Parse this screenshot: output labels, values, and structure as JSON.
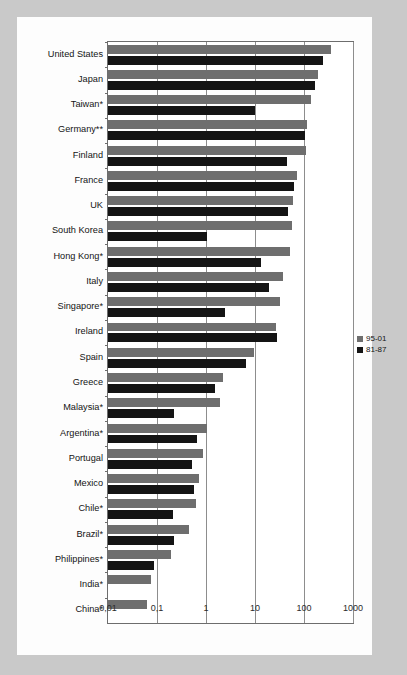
{
  "chart_data": {
    "type": "bar",
    "orientation": "horizontal",
    "title": "",
    "subtitle": "",
    "xlabel": "",
    "ylabel": "",
    "scale": "log",
    "xlim": [
      0.01,
      1000
    ],
    "grid": true,
    "legend_position": "right",
    "decimal_separator": ",",
    "xticks": [
      "0,01",
      "0,1",
      "1",
      "10",
      "100",
      "1000"
    ],
    "xtick_values": [
      0.01,
      0.1,
      1,
      10,
      100,
      1000
    ],
    "categories": [
      "United States",
      "Japan",
      "Taiwan*",
      "Germany**",
      "Finland",
      "France",
      "UK",
      "South Korea",
      "Hong Kong*",
      "Italy",
      "Singapore*",
      "Ireland",
      "Spain",
      "Greece",
      "Malaysia*",
      "Argentina*",
      "Portugal",
      "Mexico",
      "Chile*",
      "Brazil*",
      "Philippines*",
      "India*",
      "China*"
    ],
    "series": [
      {
        "name": "95-01",
        "color": "#6e6e6e",
        "values": [
          360,
          190,
          140,
          115,
          110,
          72,
          60,
          57,
          52,
          38,
          33,
          27,
          9.5,
          2.2,
          1.9,
          1.05,
          0.85,
          0.72,
          0.62,
          0.45,
          0.19,
          0.075,
          0.062
        ]
      },
      {
        "name": "81-87",
        "color": "#141414",
        "values": [
          240,
          170,
          10,
          105,
          46,
          62,
          48,
          1.05,
          13,
          19,
          2.4,
          28,
          6.5,
          1.5,
          0.22,
          0.66,
          0.52,
          0.57,
          0.21,
          0.22,
          0.085,
          null,
          null
        ]
      }
    ]
  },
  "legend": {
    "items": [
      {
        "label": "95-01",
        "color": "#6e6e6e"
      },
      {
        "label": "81-87",
        "color": "#141414"
      }
    ]
  },
  "colors": {
    "page_background": "#c9c9c9",
    "panel_background": "#fdfdfd",
    "plot_background": "#ffffff",
    "frame": "#6d6d6d",
    "gridline": "#8d8d8d",
    "series_95_01": "#6e6e6e",
    "series_81_87": "#141414",
    "text": "#141414"
  }
}
